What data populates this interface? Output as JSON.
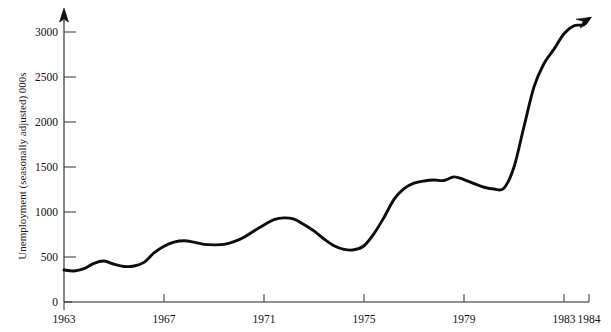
{
  "chart_data": {
    "type": "line",
    "title": "",
    "xlabel": "",
    "ylabel": "Unemployment (seasonally adjusted) 000s",
    "xlim": [
      1963,
      1984
    ],
    "ylim": [
      0,
      3200
    ],
    "grid": false,
    "legend": null,
    "y_ticks": [
      0,
      500,
      1000,
      1500,
      2000,
      2500,
      3000
    ],
    "y_tick_labels": [
      "0",
      "500",
      "1000",
      "1500",
      "2000",
      "2500",
      "3000"
    ],
    "x_ticks": [
      1963,
      1967,
      1971,
      1975,
      1979,
      1983,
      1984
    ],
    "x_tick_labels": [
      "1963",
      "1967",
      "1971",
      "1975",
      "1979",
      "1983",
      "1984"
    ],
    "series": [
      {
        "name": "Unemployment (seasonally adjusted) 000s",
        "color": "#0d0d0d",
        "terminator": "arrow",
        "x": [
          1963.0,
          1963.4,
          1963.8,
          1964.2,
          1964.6,
          1965.0,
          1965.4,
          1965.8,
          1966.2,
          1966.6,
          1967.0,
          1967.4,
          1967.8,
          1968.2,
          1968.6,
          1969.0,
          1969.4,
          1969.8,
          1970.2,
          1970.6,
          1971.0,
          1971.4,
          1971.8,
          1972.2,
          1972.6,
          1973.0,
          1973.4,
          1973.8,
          1974.2,
          1974.6,
          1975.0,
          1975.4,
          1975.8,
          1976.2,
          1976.6,
          1977.0,
          1977.4,
          1977.8,
          1978.2,
          1978.6,
          1979.0,
          1979.4,
          1979.8,
          1980.2,
          1980.6,
          1981.0,
          1981.4,
          1981.8,
          1982.2,
          1982.6,
          1983.0,
          1983.4,
          1983.8,
          1984.0
        ],
        "y": [
          355,
          345,
          370,
          430,
          455,
          420,
          395,
          400,
          440,
          545,
          620,
          665,
          680,
          665,
          640,
          635,
          640,
          670,
          720,
          790,
          855,
          915,
          935,
          920,
          860,
          790,
          700,
          625,
          585,
          580,
          625,
          760,
          940,
          1140,
          1260,
          1320,
          1345,
          1355,
          1350,
          1390,
          1360,
          1315,
          1275,
          1255,
          1265,
          1500,
          1950,
          2390,
          2650,
          2810,
          2980,
          3070,
          3080,
          3150
        ]
      }
    ],
    "annotations": {
      "start_value": 355,
      "end_value": 3150,
      "peak_1972": 935,
      "trough_1974": 580,
      "plateau_1978": 1390,
      "trough_1980": 1255
    }
  },
  "axis": {
    "y_title": "Unemployment (seasonally adjusted) 000s",
    "y_arrow": "up-arrow",
    "curve_arrow": "right-arrow"
  }
}
